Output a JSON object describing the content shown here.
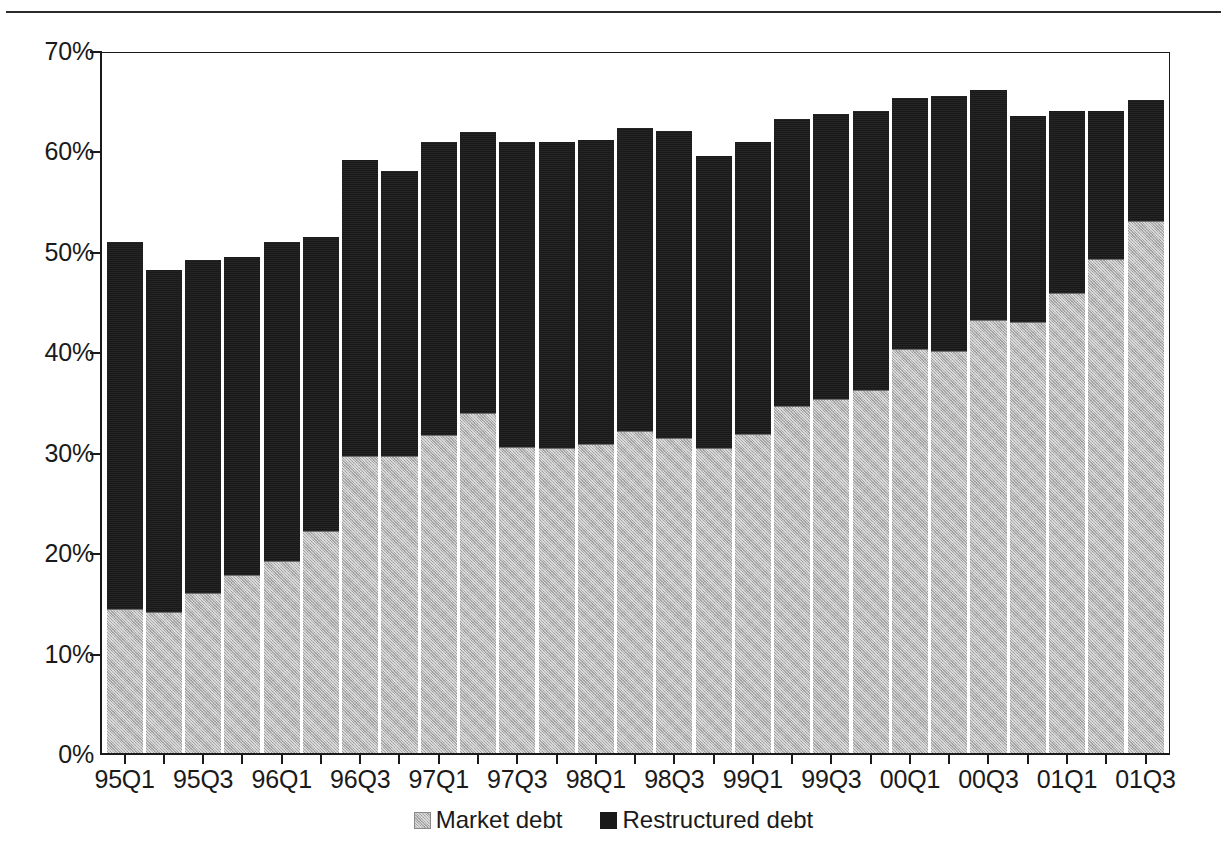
{
  "chart_data": {
    "type": "bar",
    "stacked": true,
    "title": "",
    "xlabel": "",
    "ylabel": "",
    "ylim": [
      0,
      70
    ],
    "y_tick_labels": [
      "0%",
      "10%",
      "20%",
      "30%",
      "40%",
      "50%",
      "60%",
      "70%"
    ],
    "y_tick_values": [
      0,
      10,
      20,
      30,
      40,
      50,
      60,
      70
    ],
    "grid": false,
    "legend_position": "bottom-center",
    "categories": [
      "95Q1",
      "95Q2",
      "95Q3",
      "95Q4",
      "96Q1",
      "96Q2",
      "96Q3",
      "96Q4",
      "97Q1",
      "97Q2",
      "97Q3",
      "97Q4",
      "98Q1",
      "98Q2",
      "98Q3",
      "98Q4",
      "99Q1",
      "99Q2",
      "99Q3",
      "99Q4",
      "00Q1",
      "00Q2",
      "00Q3",
      "00Q4",
      "01Q1",
      "01Q2",
      "01Q3"
    ],
    "visible_tick_labels": [
      "95Q1",
      "95Q3",
      "96Q1",
      "96Q3",
      "97Q1",
      "97Q3",
      "98Q1",
      "98Q3",
      "99Q1",
      "99Q3",
      "00Q1",
      "00Q3",
      "01Q1",
      "01Q3"
    ],
    "series": [
      {
        "name": "Market debt",
        "color": "#b3b3b3",
        "values": [
          14.3,
          14.0,
          15.9,
          17.7,
          19.1,
          22.1,
          29.6,
          29.6,
          31.7,
          33.9,
          30.5,
          30.4,
          30.8,
          32.1,
          31.4,
          30.4,
          31.8,
          34.6,
          35.3,
          36.1,
          40.2,
          40.0,
          43.1,
          42.9,
          45.8,
          49.2,
          53.0
        ]
      },
      {
        "name": "Restructured debt",
        "color": "#191919",
        "values": [
          36.6,
          34.1,
          33.2,
          31.7,
          31.8,
          29.3,
          29.4,
          28.4,
          29.1,
          27.9,
          30.3,
          30.4,
          30.2,
          30.1,
          30.5,
          29.0,
          29.0,
          28.5,
          28.3,
          27.8,
          25.0,
          25.4,
          22.9,
          20.5,
          18.1,
          14.7,
          12.0
        ]
      }
    ],
    "totals": [
      50.9,
      48.1,
      49.1,
      49.4,
      50.9,
      51.4,
      59.0,
      58.0,
      60.8,
      61.8,
      60.8,
      60.8,
      61.0,
      62.2,
      61.9,
      59.4,
      60.8,
      63.1,
      63.6,
      63.9,
      65.2,
      65.4,
      66.0,
      63.4,
      63.9,
      63.9,
      65.0
    ]
  },
  "legend": {
    "entries": [
      {
        "label": "Market debt",
        "swatch": "market-debt-swatch"
      },
      {
        "label": "Restructured debt",
        "swatch": "restructured-debt-swatch"
      }
    ]
  }
}
